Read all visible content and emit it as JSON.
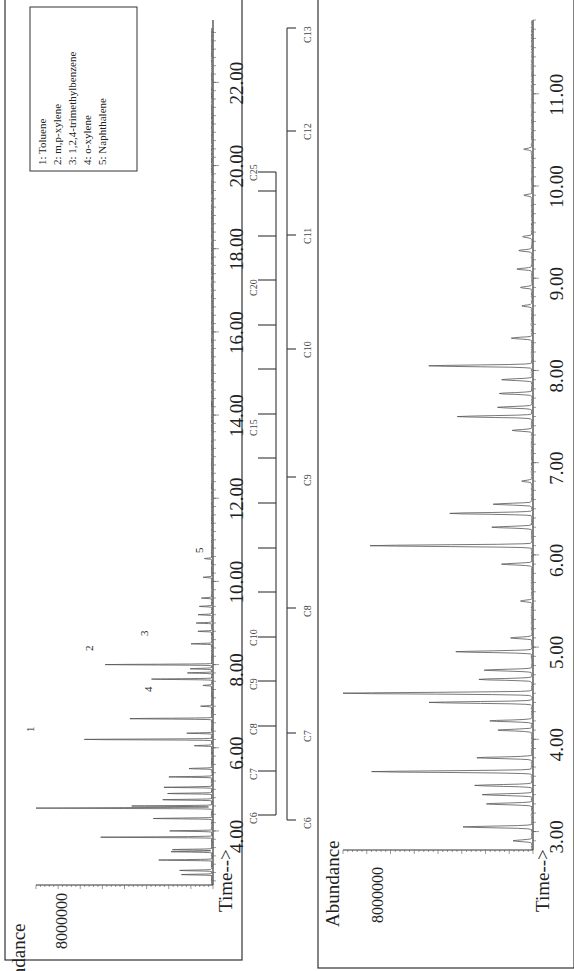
{
  "chart_data": [
    {
      "type": "line",
      "title": "Chromatogram A (full run)",
      "ylabel": "Abundance",
      "xlabel": "Time-->",
      "y_tick_label": "8000000",
      "xlim": [
        2.7,
        23.5
      ],
      "x_ticks": [
        "4.00",
        "6.00",
        "8.00",
        "10.00",
        "12.00",
        "14.00",
        "16.00",
        "18.00",
        "20.00",
        "22.00"
      ],
      "peaks": [
        {
          "time": 2.95,
          "rel_height": 0.17
        },
        {
          "time": 3.05,
          "rel_height": 0.18
        },
        {
          "time": 3.3,
          "rel_height": 0.3
        },
        {
          "time": 3.5,
          "rel_height": 0.23
        },
        {
          "time": 3.55,
          "rel_height": 0.22
        },
        {
          "time": 3.85,
          "rel_height": 0.63
        },
        {
          "time": 4.0,
          "rel_height": 0.24
        },
        {
          "time": 4.3,
          "rel_height": 0.33
        },
        {
          "time": 4.55,
          "rel_height": 1.0,
          "label": "1"
        },
        {
          "time": 4.6,
          "rel_height": 0.45
        },
        {
          "time": 4.75,
          "rel_height": 0.28
        },
        {
          "time": 4.9,
          "rel_height": 0.25
        },
        {
          "time": 5.05,
          "rel_height": 0.27
        },
        {
          "time": 5.3,
          "rel_height": 0.24
        },
        {
          "time": 5.5,
          "rel_height": 0.13
        },
        {
          "time": 6.05,
          "rel_height": 0.1
        },
        {
          "time": 6.2,
          "rel_height": 0.72,
          "label": "2"
        },
        {
          "time": 6.35,
          "rel_height": 0.14
        },
        {
          "time": 6.7,
          "rel_height": 0.46,
          "label": "4"
        },
        {
          "time": 7.0,
          "rel_height": 0.06
        },
        {
          "time": 7.5,
          "rel_height": 0.05
        },
        {
          "time": 7.65,
          "rel_height": 0.34
        },
        {
          "time": 7.8,
          "rel_height": 0.14
        },
        {
          "time": 7.9,
          "rel_height": 0.12
        },
        {
          "time": 8.0,
          "rel_height": 0.6,
          "label": "3"
        },
        {
          "time": 8.5,
          "rel_height": 0.12
        },
        {
          "time": 8.8,
          "rel_height": 0.08
        },
        {
          "time": 9.0,
          "rel_height": 0.09
        },
        {
          "time": 9.2,
          "rel_height": 0.08
        },
        {
          "time": 9.4,
          "rel_height": 0.07
        },
        {
          "time": 9.6,
          "rel_height": 0.06
        },
        {
          "time": 10.1,
          "rel_height": 0.05
        },
        {
          "time": 10.55,
          "rel_height": 0.04,
          "label": "5"
        }
      ],
      "annotations": [
        "1",
        "2",
        "3",
        "4",
        "5"
      ],
      "legend": [
        "1: Toluene",
        "2: m,p-xylene",
        "3: 1,2,4-trimethylbenzene",
        "4: o-xylene",
        "5: Naphthalene"
      ],
      "carbon_ladder": [
        "C6",
        "C7",
        "C8",
        "C9",
        "C10",
        "C15",
        "C20",
        "C25"
      ],
      "legend_position": "upper-right"
    },
    {
      "type": "line",
      "title": "Chromatogram B (expanded 3-11.5 min)",
      "ylabel": "Abundance",
      "xlabel": "Time-->",
      "y_tick_label": "8000000",
      "xlim": [
        2.8,
        11.8
      ],
      "x_ticks": [
        "3.00",
        "4.00",
        "5.00",
        "6.00",
        "7.00",
        "8.00",
        "9.00",
        "10.00",
        "11.00"
      ],
      "peaks": [
        {
          "time": 2.9,
          "rel_height": 0.1
        },
        {
          "time": 3.05,
          "rel_height": 0.36
        },
        {
          "time": 3.3,
          "rel_height": 0.24
        },
        {
          "time": 3.4,
          "rel_height": 0.26
        },
        {
          "time": 3.5,
          "rel_height": 0.3
        },
        {
          "time": 3.65,
          "rel_height": 0.84
        },
        {
          "time": 3.8,
          "rel_height": 0.29
        },
        {
          "time": 4.1,
          "rel_height": 0.18
        },
        {
          "time": 4.2,
          "rel_height": 0.22
        },
        {
          "time": 4.4,
          "rel_height": 0.54
        },
        {
          "time": 4.5,
          "rel_height": 1.0
        },
        {
          "time": 4.65,
          "rel_height": 0.28
        },
        {
          "time": 4.75,
          "rel_height": 0.25
        },
        {
          "time": 4.95,
          "rel_height": 0.4
        },
        {
          "time": 5.1,
          "rel_height": 0.11
        },
        {
          "time": 5.5,
          "rel_height": 0.06
        },
        {
          "time": 5.9,
          "rel_height": 0.16
        },
        {
          "time": 6.1,
          "rel_height": 0.85
        },
        {
          "time": 6.3,
          "rel_height": 0.21
        },
        {
          "time": 6.45,
          "rel_height": 0.43
        },
        {
          "time": 6.55,
          "rel_height": 0.2
        },
        {
          "time": 6.8,
          "rel_height": 0.05
        },
        {
          "time": 7.35,
          "rel_height": 0.1
        },
        {
          "time": 7.5,
          "rel_height": 0.39
        },
        {
          "time": 7.6,
          "rel_height": 0.18
        },
        {
          "time": 7.75,
          "rel_height": 0.17
        },
        {
          "time": 7.9,
          "rel_height": 0.16
        },
        {
          "time": 8.05,
          "rel_height": 0.54
        },
        {
          "time": 8.35,
          "rel_height": 0.11
        },
        {
          "time": 8.7,
          "rel_height": 0.05
        },
        {
          "time": 8.9,
          "rel_height": 0.06
        },
        {
          "time": 9.1,
          "rel_height": 0.08
        },
        {
          "time": 9.3,
          "rel_height": 0.07
        },
        {
          "time": 9.45,
          "rel_height": 0.05
        },
        {
          "time": 9.9,
          "rel_height": 0.04
        },
        {
          "time": 10.4,
          "rel_height": 0.04
        }
      ],
      "carbon_ladder": [
        "C6",
        "C7",
        "C8",
        "C9",
        "C10",
        "C11",
        "C12",
        "C13"
      ]
    }
  ],
  "panel_a": {
    "ylabel": "Abundance",
    "y_tick": "8000000",
    "xlabel": "Time-->",
    "x_ticks": [
      "4.00",
      "6.00",
      "8.00",
      "10.00",
      "12.00",
      "14.00",
      "16.00",
      "18.00",
      "20.00",
      "22.00"
    ],
    "peak_labels": [
      "1",
      "2",
      "3",
      "4",
      "5"
    ],
    "legend": [
      "1:  Toluene",
      "2:  m,p-xylene",
      "3:  1,2,4-trimethylbenzene",
      "4:  o-xylene",
      "5:  Naphthalene"
    ],
    "ladder": [
      "C6",
      "C7",
      "C8",
      "C9",
      "C10",
      "C15",
      "C20",
      "C25"
    ]
  },
  "panel_b": {
    "ylabel": "Abundance",
    "y_tick": "8000000",
    "xlabel": "Time-->",
    "x_ticks": [
      "3.00",
      "4.00",
      "5.00",
      "6.00",
      "7.00",
      "8.00",
      "9.00",
      "10.00",
      "11.00"
    ],
    "ladder": [
      "C6",
      "C7",
      "C8",
      "C9",
      "C10",
      "C11",
      "C12",
      "C13"
    ]
  }
}
